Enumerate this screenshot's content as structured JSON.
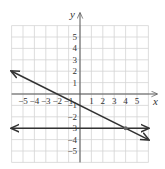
{
  "chart_data": {
    "type": "line",
    "title": "",
    "xlabel": "x",
    "ylabel": "y",
    "xlim": [
      -6,
      6
    ],
    "ylim": [
      -6,
      6
    ],
    "grid": true,
    "x_ticks": [
      -5,
      -4,
      -3,
      -2,
      -1,
      1,
      2,
      3,
      4,
      5
    ],
    "y_ticks": [
      5,
      4,
      3,
      2,
      1,
      -1,
      -2,
      -3,
      -4,
      -5
    ],
    "x_tick_labels": [
      "−5",
      "−4",
      "−3",
      "−2",
      "−1",
      "1",
      "2",
      "3",
      "4",
      "5"
    ],
    "y_tick_labels": [
      "5",
      "4",
      "3",
      "2",
      "1",
      "−1",
      "−2",
      "−3",
      "−4",
      "−5"
    ],
    "series": [
      {
        "name": "line-1",
        "equation": "y = -1/2 x - 1",
        "x": [
          -6,
          -2,
          0,
          4,
          6
        ],
        "y": [
          2,
          0,
          -1,
          -3,
          -4
        ],
        "arrows": "both",
        "color": "#333333"
      },
      {
        "name": "line-2",
        "equation": "y = -3",
        "x": [
          -6,
          6
        ],
        "y": [
          -3,
          -3
        ],
        "arrows": "both",
        "color": "#333333"
      }
    ],
    "points": [
      {
        "label": "intersection",
        "x": 4,
        "y": -3
      }
    ]
  },
  "labels": {
    "x_axis": "x",
    "y_axis": "y"
  },
  "colors": {
    "grid": "#d4d4d4",
    "axis": "#555555",
    "line": "#333333"
  }
}
